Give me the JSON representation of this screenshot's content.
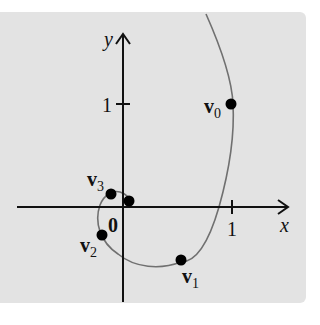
{
  "figure": {
    "type": "trajectory-diagram",
    "axes": {
      "x_label": "x",
      "y_label": "y",
      "origin_label": "0",
      "x_tick_label": "1",
      "y_tick_label": "1"
    },
    "points": [
      {
        "name": "v0",
        "base": "v",
        "sub": "0",
        "x": 1.0,
        "y": 1.0
      },
      {
        "name": "v1",
        "base": "v",
        "sub": "1",
        "x": 0.54,
        "y": -0.52
      },
      {
        "name": "v2",
        "base": "v",
        "sub": "2",
        "x": -0.2,
        "y": -0.27
      },
      {
        "name": "v3",
        "base": "v",
        "sub": "3",
        "x": -0.11,
        "y": 0.13
      },
      {
        "name": "v4",
        "base": "",
        "sub": "",
        "x": 0.05,
        "y": 0.06
      }
    ],
    "colors": {
      "background": "#e3e3e3",
      "axis": "#111111",
      "curve": "#707070",
      "point": "#000000"
    }
  }
}
